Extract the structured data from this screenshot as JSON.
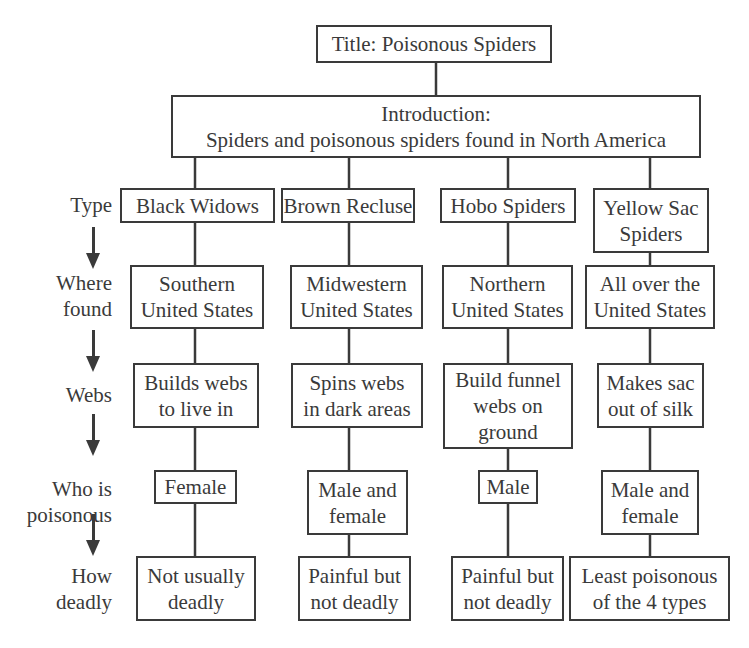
{
  "title": "Title: Poisonous Spiders",
  "introduction": "Introduction:\nSpiders and poisonous spiders found in North America",
  "row_labels": {
    "type": "Type",
    "where_found": "Where\nfound",
    "webs": "Webs",
    "who_is_poisonous": "Who is\npoisonous",
    "how_deadly": "How\ndeadly"
  },
  "columns": [
    {
      "type": "Black Widows",
      "where_found": "Southern\nUnited States",
      "webs": "Builds webs\nto live in",
      "who_is_poisonous": "Female",
      "how_deadly": "Not usually\ndeadly"
    },
    {
      "type": "Brown Recluse",
      "where_found": "Midwestern\nUnited States",
      "webs": "Spins webs\nin dark areas",
      "who_is_poisonous": "Male and\nfemale",
      "how_deadly": "Painful but\nnot deadly"
    },
    {
      "type": "Hobo Spiders",
      "where_found": "Northern\nUnited States",
      "webs": "Build funnel\nwebs on\nground",
      "who_is_poisonous": "Male",
      "how_deadly": "Painful but\nnot deadly"
    },
    {
      "type": "Yellow Sac\nSpiders",
      "where_found": "All over the\nUnited States",
      "webs": "Makes sac\nout of silk",
      "who_is_poisonous": "Male and\nfemale",
      "how_deadly": "Least poisonous\nof the 4 types"
    }
  ],
  "colors": {
    "stroke": "#3a3a3a",
    "background": "#ffffff"
  },
  "icons": {
    "row_arrow": "arrow-down-icon"
  }
}
